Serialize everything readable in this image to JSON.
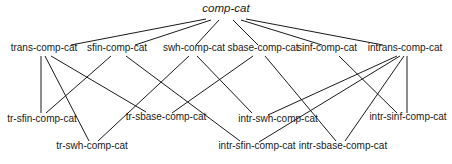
{
  "diagram": {
    "type": "hierarchy",
    "root": "comp-cat",
    "nodes": [
      {
        "id": "comp-cat",
        "label": "comp-cat",
        "x": 226,
        "y": 12,
        "level": 0,
        "italic": true
      },
      {
        "id": "trans-comp-cat",
        "label": "trans-comp-cat",
        "x": 44,
        "y": 51,
        "level": 1
      },
      {
        "id": "sfin-comp-cat",
        "label": "sfin-comp-cat",
        "x": 117,
        "y": 51,
        "level": 1
      },
      {
        "id": "swh-comp-cat",
        "label": "swh-comp-cat",
        "x": 194,
        "y": 51,
        "level": 1
      },
      {
        "id": "sbase-comp-cat",
        "label": "sbase-comp-cat",
        "x": 263,
        "y": 51,
        "level": 1
      },
      {
        "id": "sinf-comp-cat",
        "label": "sinf-comp-cat",
        "x": 327,
        "y": 51,
        "level": 1
      },
      {
        "id": "intrans-comp-cat",
        "label": "intrans-comp-cat",
        "x": 405,
        "y": 51,
        "level": 1
      },
      {
        "id": "tr-sfin-comp-cat",
        "label": "tr-sfin-comp-cat",
        "x": 42,
        "y": 122,
        "level": 2
      },
      {
        "id": "tr-sbase-comp-cat",
        "label": "tr-sbase-comp-cat",
        "x": 166,
        "y": 120,
        "level": 2
      },
      {
        "id": "intr-swh-comp-cat",
        "label": "intr-swh-comp-cat",
        "x": 278,
        "y": 122,
        "level": 2
      },
      {
        "id": "intr-sinf-comp-cat",
        "label": "intr-sinf-comp-cat",
        "x": 408,
        "y": 120,
        "level": 2
      },
      {
        "id": "tr-swh-comp-cat",
        "label": "tr-swh-comp-cat",
        "x": 92,
        "y": 149,
        "level": 3
      },
      {
        "id": "intr-sfin-comp-cat",
        "label": "intr-sfin-comp-cat",
        "x": 257,
        "y": 149,
        "level": 3
      },
      {
        "id": "intr-sbase-comp-cat",
        "label": "intr-sbase-comp-cat",
        "x": 343,
        "y": 149,
        "level": 3
      }
    ],
    "edges": [
      {
        "from": "comp-cat",
        "to": "trans-comp-cat",
        "x1": 206,
        "y1": 19,
        "x2": 71,
        "y2": 45
      },
      {
        "from": "comp-cat",
        "to": "sfin-comp-cat",
        "x1": 211,
        "y1": 20,
        "x2": 135,
        "y2": 45
      },
      {
        "from": "comp-cat",
        "to": "swh-comp-cat",
        "x1": 219,
        "y1": 20,
        "x2": 196,
        "y2": 45
      },
      {
        "from": "comp-cat",
        "to": "sbase-comp-cat",
        "x1": 233,
        "y1": 20,
        "x2": 258,
        "y2": 45
      },
      {
        "from": "comp-cat",
        "to": "sinf-comp-cat",
        "x1": 241,
        "y1": 20,
        "x2": 322,
        "y2": 45
      },
      {
        "from": "comp-cat",
        "to": "intrans-comp-cat",
        "x1": 246,
        "y1": 19,
        "x2": 383,
        "y2": 45
      },
      {
        "from": "trans-comp-cat",
        "to": "tr-sfin-comp-cat",
        "x1": 41,
        "y1": 56,
        "x2": 41,
        "y2": 113
      },
      {
        "from": "trans-comp-cat",
        "to": "tr-swh-comp-cat",
        "x1": 45,
        "y1": 56,
        "x2": 89,
        "y2": 141
      },
      {
        "from": "trans-comp-cat",
        "to": "tr-sbase-comp-cat",
        "x1": 51,
        "y1": 56,
        "x2": 146,
        "y2": 112
      },
      {
        "from": "sfin-comp-cat",
        "to": "tr-sfin-comp-cat",
        "x1": 111,
        "y1": 56,
        "x2": 46,
        "y2": 113
      },
      {
        "from": "sfin-comp-cat",
        "to": "intr-sfin-comp-cat",
        "x1": 126,
        "y1": 56,
        "x2": 240,
        "y2": 141
      },
      {
        "from": "swh-comp-cat",
        "to": "tr-swh-comp-cat",
        "x1": 189,
        "y1": 56,
        "x2": 98,
        "y2": 141
      },
      {
        "from": "swh-comp-cat",
        "to": "intr-swh-comp-cat",
        "x1": 197,
        "y1": 56,
        "x2": 252,
        "y2": 113
      },
      {
        "from": "sbase-comp-cat",
        "to": "tr-sbase-comp-cat",
        "x1": 253,
        "y1": 56,
        "x2": 172,
        "y2": 113
      },
      {
        "from": "sbase-comp-cat",
        "to": "intr-sbase-comp-cat",
        "x1": 265,
        "y1": 56,
        "x2": 336,
        "y2": 141
      },
      {
        "from": "sinf-comp-cat",
        "to": "intr-sinf-comp-cat",
        "x1": 339,
        "y1": 56,
        "x2": 397,
        "y2": 113
      },
      {
        "from": "intrans-comp-cat",
        "to": "intr-swh-comp-cat",
        "x1": 397,
        "y1": 56,
        "x2": 268,
        "y2": 115
      },
      {
        "from": "intrans-comp-cat",
        "to": "intr-sfin-comp-cat",
        "x1": 400,
        "y1": 56,
        "x2": 259,
        "y2": 142
      },
      {
        "from": "intrans-comp-cat",
        "to": "intr-sbase-comp-cat",
        "x1": 404,
        "y1": 56,
        "x2": 345,
        "y2": 141
      },
      {
        "from": "intrans-comp-cat",
        "to": "intr-sinf-comp-cat",
        "x1": 407,
        "y1": 56,
        "x2": 407,
        "y2": 113
      }
    ]
  }
}
